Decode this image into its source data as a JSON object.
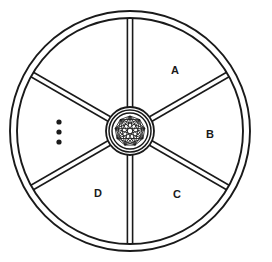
{
  "figure": {
    "background_color": "#ffffff",
    "stroke_color": "#1a1a1a"
  },
  "wheel": {
    "center_x": 130,
    "center_y": 131,
    "rim_outer_radius": 120,
    "rim_inner_radius": 113,
    "hub_outer_radius": 24,
    "hub_mid_radius": 21,
    "hub_inner_radius": 18,
    "hub_star_radius": 15,
    "spoke_half_width": 2.6,
    "spoke_count": 6,
    "spoke_angles_deg": [
      90,
      30,
      -30,
      -90,
      -150,
      150
    ]
  },
  "hub": {
    "name": "star-mesh-hub",
    "star_points": 9,
    "star_skip": 4,
    "mesh_description": "inscribed star polygon mesh inside concentric circles"
  },
  "sector_labels": [
    {
      "id": "A",
      "text": "A",
      "x": 175,
      "y": 71
    },
    {
      "id": "B",
      "text": "B",
      "x": 210,
      "y": 135
    },
    {
      "id": "C",
      "text": "C",
      "x": 177,
      "y": 195
    },
    {
      "id": "D",
      "text": "D",
      "x": 98,
      "y": 194
    },
    {
      "id": "ellipsis",
      "text": "",
      "x": 59,
      "y": 132
    }
  ],
  "ellipsis": {
    "name": "vertical-ellipsis",
    "dot_count": 3,
    "dot_radius": 2.6,
    "x": 59,
    "dot_y_values": [
      122,
      132,
      142
    ]
  }
}
